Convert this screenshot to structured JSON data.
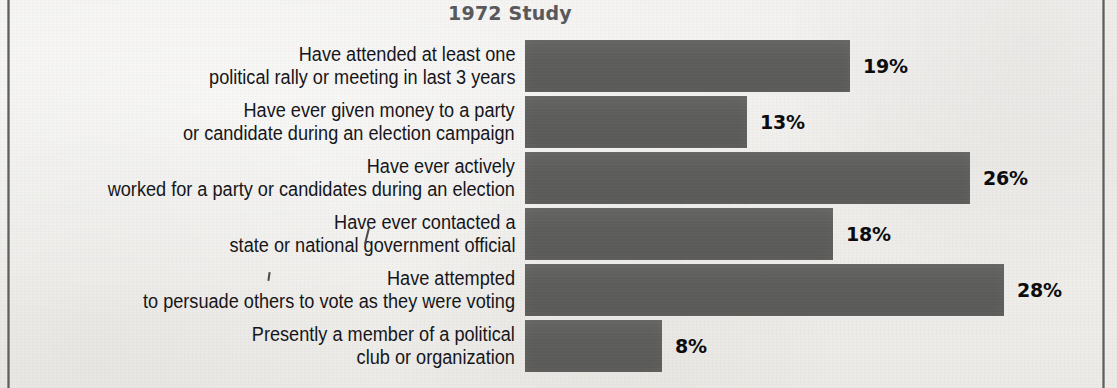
{
  "chart_data": {
    "type": "bar",
    "orientation": "horizontal",
    "title": "1972 Study",
    "xlabel": "",
    "ylabel": "",
    "xlim": [
      0,
      35
    ],
    "grid": false,
    "legend": false,
    "value_suffix": "%",
    "categories": [
      "Have attended at least one political rally or meeting in last 3 years",
      "Have ever given money to a party or candidate during an election campaign",
      "Have ever actively worked for a party or candidates during an election",
      "Have ever contacted a state or national government official",
      "Have attempted to persuade others to vote as they were voting",
      "Presently a member of a political club or organization"
    ],
    "values": [
      19,
      13,
      26,
      18,
      28,
      8
    ],
    "value_labels": [
      "19%",
      "13%",
      "26%",
      "18%",
      "28%",
      "8%"
    ]
  },
  "chart": {
    "title": "1972 Study",
    "bar_color": "#5d5d5c",
    "title_color": "#59595b",
    "label_color": "#16161a",
    "rows": [
      {
        "line1": "Have attended at least one",
        "line2": "political rally or meeting in last 3 years",
        "value": 19,
        "value_label": "19%"
      },
      {
        "line1": "Have ever given money to a party",
        "line2": "or candidate during an election campaign",
        "value": 13,
        "value_label": "13%"
      },
      {
        "line1": "Have ever actively",
        "line2": "worked for a party or candidates during an election",
        "value": 26,
        "value_label": "26%"
      },
      {
        "line1": "Have ever contacted a",
        "line2": "state or national government official",
        "value": 18,
        "value_label": "18%"
      },
      {
        "line1": "Have attempted",
        "line2": "to persuade others to vote as they were voting",
        "value": 28,
        "value_label": "28%"
      },
      {
        "line1": "Presently a member of a political",
        "line2": "club or organization",
        "value": 8,
        "value_label": "8%"
      }
    ]
  }
}
